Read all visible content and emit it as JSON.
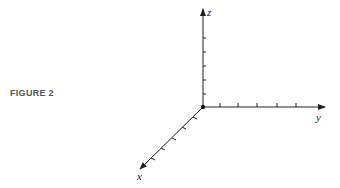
{
  "figure": {
    "label": "FIGURE 2",
    "label_color": "#555555",
    "axis_color": "#222222"
  },
  "axes": {
    "x": {
      "label": "x",
      "ticks": 5
    },
    "y": {
      "label": "y",
      "ticks": 5
    },
    "z": {
      "label": "z",
      "ticks": 5
    }
  },
  "origin": {
    "marker": "origin-dot"
  }
}
